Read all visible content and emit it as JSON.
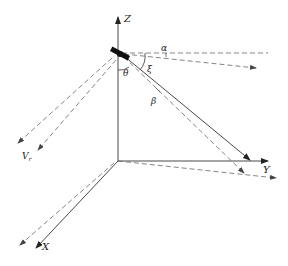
{
  "diagram": {
    "type": "satellite-geometry-3d-axes",
    "axes": {
      "z_label": "Z",
      "y_label": "Y",
      "x_label": "X"
    },
    "angles": {
      "alpha": "α",
      "xi": "ξ",
      "theta": "θ",
      "beta": "β"
    },
    "vectors": {
      "velocity_label": "V",
      "velocity_subscript": "r"
    },
    "colors": {
      "axis": "#333333",
      "dashed": "#666666",
      "satellite": "#111111"
    }
  }
}
